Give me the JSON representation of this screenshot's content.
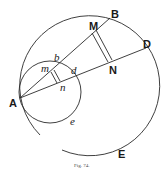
{
  "figure": {
    "caption": "Fig. 74.",
    "labels": {
      "A": "A",
      "B": "B",
      "D": "D",
      "M": "M",
      "N": "N",
      "E": "E",
      "b": "b",
      "m": "m",
      "d": "d",
      "n": "n",
      "e": "e"
    },
    "elements": [
      "large circle through A, B, D, E",
      "small circle through A, b, d, e",
      "line A-B",
      "line A-D",
      "double segment M-N",
      "double segment m-n"
    ]
  }
}
